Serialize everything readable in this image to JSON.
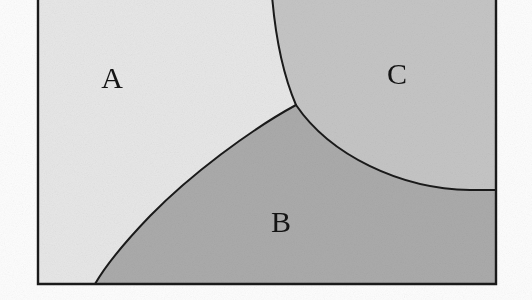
{
  "figure": {
    "type": "region-partition-diagram",
    "caption_visible": false,
    "canvas": {
      "width": 532,
      "height": 300
    },
    "background_color": "#fdfdfd",
    "frame": {
      "name": "bounding-rectangle",
      "left": 38,
      "right": 496,
      "bottom": 284,
      "top_cropped": true,
      "border_color": "#1a1a1a",
      "border_width": 2
    },
    "regions": [
      {
        "id": "A",
        "label": "A",
        "position": "top-left",
        "fill_color": "#e7e7e7",
        "label_x": 112,
        "label_y": 88,
        "font_size": 30
      },
      {
        "id": "B",
        "label": "B",
        "position": "bottom",
        "fill_color": "#ababab",
        "label_x": 281,
        "label_y": 232,
        "font_size": 30
      },
      {
        "id": "C",
        "label": "C",
        "position": "top-right",
        "fill_color": "#c5c5c5",
        "label_x": 397,
        "label_y": 84,
        "font_size": 30
      }
    ],
    "boundaries": [
      {
        "name": "arc-a-c",
        "between": [
          "A",
          "C"
        ],
        "from": {
          "x": 270,
          "y": 0
        },
        "to": {
          "x": 296,
          "y": 105
        },
        "stroke_color": "#1a1a1a",
        "stroke_width": 2
      },
      {
        "name": "arc-b-c",
        "between": [
          "B",
          "C"
        ],
        "from": {
          "x": 296,
          "y": 105
        },
        "to": {
          "x": 496,
          "y": 190
        },
        "stroke_color": "#1a1a1a",
        "stroke_width": 2
      },
      {
        "name": "arc-a-b",
        "between": [
          "A",
          "B"
        ],
        "from": {
          "x": 95,
          "y": 284
        },
        "to": {
          "x": 296,
          "y": 105
        },
        "stroke_color": "#1a1a1a",
        "stroke_width": 2
      }
    ],
    "triple_point": {
      "x": 296,
      "y": 105
    }
  }
}
